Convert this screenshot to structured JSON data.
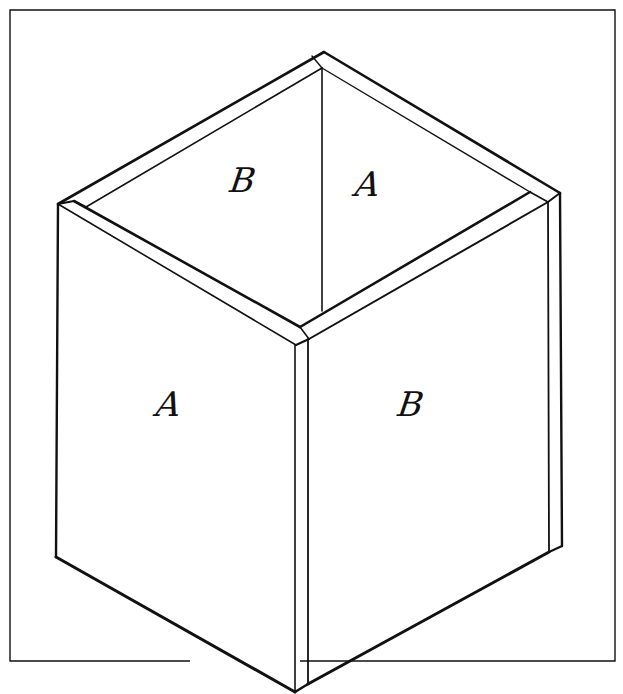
{
  "figure": {
    "colors": {
      "stroke": "#111111",
      "background": "#ffffff"
    }
  },
  "labels": {
    "inner_back_left": {
      "text": "B",
      "x": 243,
      "y": 180
    },
    "inner_back_right": {
      "text": "A",
      "x": 368,
      "y": 184
    },
    "outer_front_left": {
      "text": "A",
      "x": 169,
      "y": 404
    },
    "outer_front_right": {
      "text": "B",
      "x": 411,
      "y": 404
    }
  }
}
